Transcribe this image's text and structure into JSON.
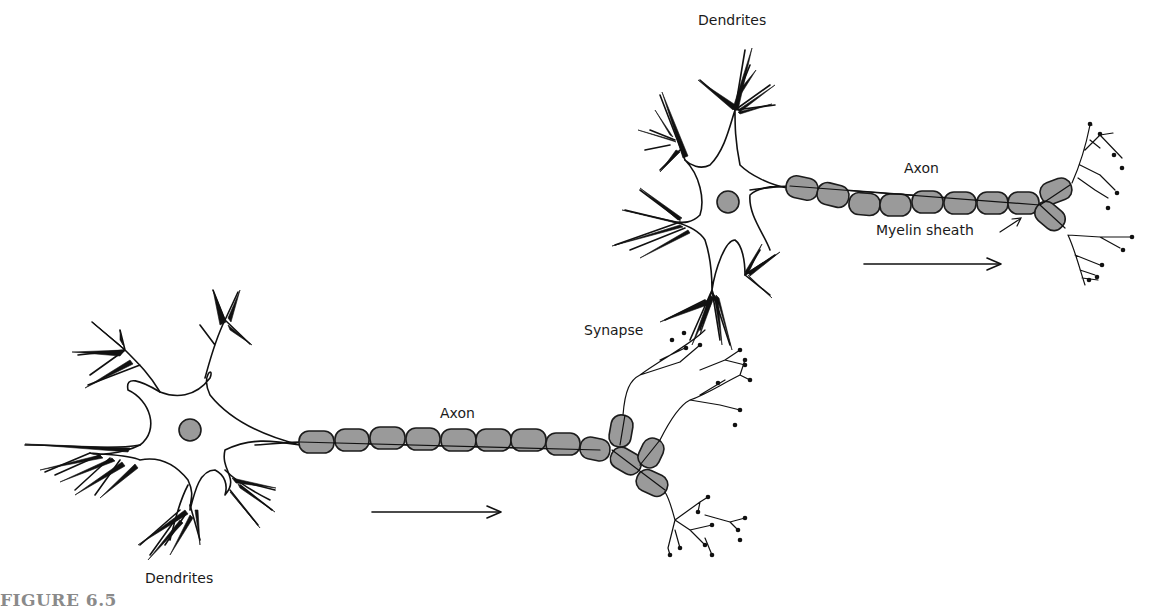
{
  "figure": {
    "caption": "FIGURE 6.5"
  },
  "labels": {
    "dendrites_bottom": "Dendrites",
    "dendrites_top": "Dendrites",
    "axon_lower": "Axon",
    "axon_upper": "Axon",
    "synapse": "Synapse",
    "myelin_sheath": "Myelin sheath"
  },
  "colors": {
    "myelin_fill": "#9a9a9a",
    "outline": "#1c1c1c",
    "caption": "#8a8a8a",
    "background": "#ffffff"
  },
  "neurons": [
    {
      "id": "lower",
      "soma_center": [
        190,
        430
      ],
      "myelin_segments": 10,
      "direction_arrow": "right"
    },
    {
      "id": "upper",
      "soma_center": [
        728,
        202
      ],
      "myelin_segments": 9,
      "direction_arrow": "right"
    }
  ]
}
